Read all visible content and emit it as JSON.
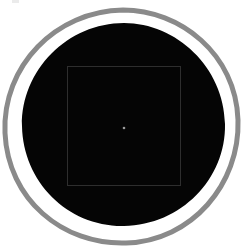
{
  "figure": {
    "canvas": {
      "width": 247,
      "height": 252,
      "background_color": "#ffffff"
    },
    "elements": {
      "outer_ring": {
        "name": "outer-gray-ring",
        "shape": "circle-outline",
        "center_x": 122,
        "center_y": 126,
        "radius": 116,
        "stroke_color": "#8a8a8a",
        "stroke_width": 5,
        "fill": "none"
      },
      "white_gap": {
        "name": "white-gap-ring",
        "shape": "ring",
        "center_x": 123,
        "center_y": 125,
        "radius": 108,
        "color": "#ffffff"
      },
      "black_disc": {
        "name": "black-disc",
        "shape": "circle-filled",
        "center_x": 124,
        "center_y": 124,
        "radius": 101,
        "fill_color": "#050505"
      },
      "inner_square": {
        "name": "inner-square-outline",
        "shape": "rectangle-outline",
        "x": 67,
        "y": 66,
        "width": 114,
        "height": 120,
        "stroke_color": "#2e2e2e",
        "stroke_width": 1,
        "fill": "none"
      },
      "center_dot": {
        "name": "center-point-marker",
        "shape": "dot",
        "center_x": 124,
        "center_y": 128,
        "radius": 1.3,
        "fill_color": "#9a9a9a"
      },
      "corner_artifact": {
        "name": "top-left-speck",
        "shape": "speck",
        "x": 12,
        "y": 0,
        "width": 7,
        "height": 3,
        "fill_color": "#e8e8e8"
      }
    }
  }
}
